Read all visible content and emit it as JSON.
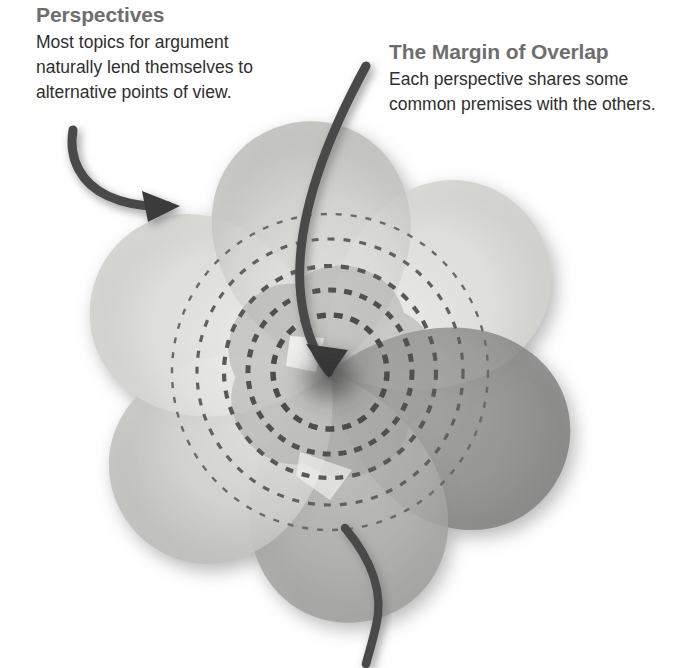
{
  "document": {
    "kind": "conceptual-diagram",
    "subject": "Perspectives and the Margin of Overlap",
    "background_color": "#ffffff"
  },
  "callouts": [
    {
      "id": "perspectives",
      "title": "Perspectives",
      "lines": [
        "Most topics for argument",
        "naturally lend themselves to",
        "alternative points of view."
      ],
      "title_color": "#6e6e6e",
      "body_color": "#2f2f2f"
    },
    {
      "id": "margin-of-overlap",
      "title": "The Margin of Overlap",
      "lines": [
        "Each perspective shares some",
        "common premises with the others."
      ],
      "title_color": "#6e6e6e",
      "body_color": "#2f2f2f"
    }
  ],
  "diagram": {
    "center": {
      "x": 330,
      "y": 372
    },
    "petal_count": 6,
    "petals": [
      {
        "label": "petal-top",
        "angle": -8,
        "fill": "#d8d8d5",
        "opacity": 0.86
      },
      {
        "label": "petal-upper-right",
        "angle": 52,
        "fill": "#e2e2df",
        "opacity": 0.86
      },
      {
        "label": "petal-right",
        "angle": 112,
        "fill": "#8e8e8c",
        "opacity": 0.8
      },
      {
        "label": "petal-lower-right",
        "angle": 172,
        "fill": "#a9a9a6",
        "opacity": 0.8
      },
      {
        "label": "petal-lower-left",
        "angle": 232,
        "fill": "#cfcfcc",
        "opacity": 0.84
      },
      {
        "label": "petal-left",
        "angle": 292,
        "fill": "#e4e4e1",
        "opacity": 0.86
      }
    ],
    "dashed_circles": [
      {
        "label": "overlap-ring-1",
        "radius": 57,
        "dash": "9 8",
        "width": 5.5,
        "color": "#4c4c4c"
      },
      {
        "label": "overlap-ring-2",
        "radius": 82,
        "dash": "8 8",
        "width": 5.0,
        "color": "#515151"
      },
      {
        "label": "overlap-ring-3",
        "radius": 106,
        "dash": "8 9",
        "width": 4.2,
        "color": "#585858"
      },
      {
        "label": "overlap-ring-4",
        "radius": 133,
        "dash": "7 9",
        "width": 3.2,
        "color": "#606060"
      },
      {
        "label": "overlap-ring-5",
        "radius": 158,
        "dash": "6 9",
        "width": 2.4,
        "color": "#6a6a6a"
      }
    ],
    "arrows": [
      {
        "label": "arrow-perspectives",
        "description": "curved arrow from upper left pointing into the top-left petal",
        "tip": {
          "x": 175,
          "y": 206
        },
        "color": "#4a4a4a"
      },
      {
        "label": "arrow-margin-of-overlap",
        "description": "long curved arrow descending from the top into the common center",
        "tip": {
          "x": 327,
          "y": 381
        },
        "color": "#4a4a4a"
      },
      {
        "label": "arrow-tail-bottom",
        "description": "curved tail exiting at the bottom of the figure",
        "color": "#4a4a4a"
      }
    ],
    "colors": {
      "lightest_petal": "#e4e4e1",
      "darkest_petal": "#8e8e8c",
      "ink": "#4a4a4a",
      "shadow": "#9a9a9a"
    }
  }
}
